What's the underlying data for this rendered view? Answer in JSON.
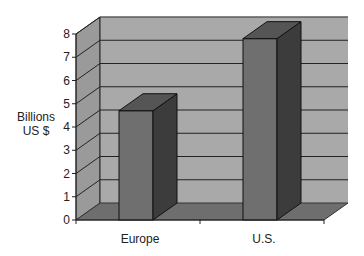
{
  "chart_data": {
    "type": "bar",
    "style": "3d-column",
    "title": "",
    "xlabel": "",
    "ylabel": "Billions US $",
    "ylabel_lines": [
      "Billions",
      "US $"
    ],
    "categories": [
      "Europe",
      "U.S."
    ],
    "values": [
      4.7,
      7.8
    ],
    "ylim": [
      0,
      8
    ],
    "yticks": [
      0,
      1,
      2,
      3,
      4,
      5,
      6,
      7,
      8
    ],
    "grid": true,
    "legend": null
  },
  "colors": {
    "wall": "#a9a9a9",
    "side_wall": "#9a9a9a",
    "floor": "#6e6e6e",
    "bar_front": "#6f6f6f",
    "bar_side": "#3c3c3c",
    "bar_top": "#555555",
    "gridline": "#222222"
  }
}
